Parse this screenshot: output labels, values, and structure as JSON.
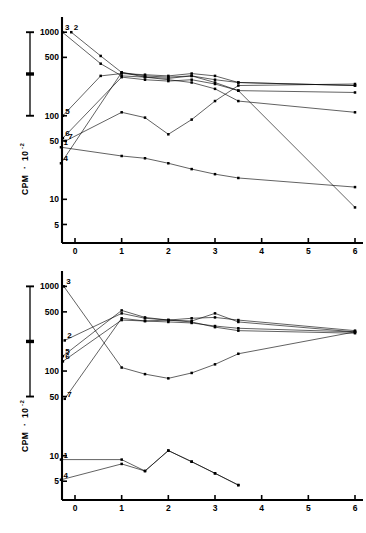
{
  "figure": {
    "panels": [
      {
        "id": "top",
        "y_axis": {
          "title_main": "CPM",
          "title_sep": "·",
          "title_base": "10",
          "title_exp": "-2",
          "tick_labels": [
            "1000",
            "500",
            "100",
            "50",
            "10",
            "5"
          ],
          "tick_values": [
            1000,
            500,
            100,
            50,
            10,
            5
          ],
          "scale": "log",
          "ylim": [
            3,
            1400
          ]
        },
        "x_axis": {
          "tick_labels": [
            "0",
            "1",
            "2",
            "3",
            "4",
            "5",
            "6"
          ],
          "tick_values": [
            0,
            1,
            2,
            3,
            4,
            5,
            6
          ],
          "scale": "linear",
          "xlim": [
            -0.45,
            6.35
          ]
        },
        "scale_bar": {
          "top_label": "1000",
          "bottom_label": "100",
          "has_mid_tick": true
        },
        "series_labels": [
          "3",
          "2",
          "5",
          "6",
          "7",
          "1",
          "4"
        ]
      },
      {
        "id": "bottom",
        "y_axis": {
          "title_main": "CPM",
          "title_sep": "·",
          "title_base": "10",
          "title_exp": "-2",
          "tick_labels": [
            "1000",
            "500",
            "100",
            "50",
            "10",
            "5"
          ],
          "tick_values": [
            1000,
            500,
            100,
            50,
            10,
            5
          ],
          "scale": "log",
          "ylim": [
            3,
            1400
          ]
        },
        "x_axis": {
          "tick_labels": [
            "0",
            "1",
            "2",
            "3",
            "4",
            "5",
            "6"
          ],
          "tick_values": [
            0,
            1,
            2,
            3,
            4,
            5,
            6
          ],
          "scale": "linear",
          "xlim": [
            -0.45,
            6.35
          ]
        },
        "scale_bar": {
          "top_label": "1000",
          "bottom_label": "50",
          "has_mid_tick": true
        },
        "series_labels": [
          "3",
          "2",
          "5",
          "6",
          "7",
          "1",
          "4"
        ]
      }
    ]
  },
  "chart_data": [
    {
      "type": "line",
      "title": "",
      "subtitle": "",
      "xlabel": "",
      "ylabel": "CPM · 10^-2",
      "yscale": "log",
      "ylim": [
        3,
        1400
      ],
      "xlim": [
        -0.45,
        6.35
      ],
      "yticks": [
        1000,
        500,
        100,
        50,
        10,
        5
      ],
      "ytick_labels": [
        "1000",
        "500",
        "100",
        "50",
        "10",
        "5"
      ],
      "xticks": [
        0,
        1,
        2,
        3,
        4,
        5,
        6
      ],
      "xtick_labels": [
        "0",
        "1",
        "2",
        "3",
        "4",
        "5",
        "6"
      ],
      "grid": false,
      "legend": "inline-numbered-labels",
      "series": [
        {
          "name": "1",
          "x": [
            -0.3,
            1.0,
            1.5,
            2.0,
            2.5,
            3.0,
            3.5,
            6.0
          ],
          "y": [
            42,
            33,
            31,
            27,
            23,
            20,
            18,
            14
          ]
        },
        {
          "name": "2",
          "x": [
            -0.08,
            0.55,
            1.0,
            1.5,
            2.0,
            2.5,
            3.0,
            3.5,
            6.0
          ],
          "y": [
            1000,
            520,
            330,
            300,
            290,
            300,
            270,
            250,
            230
          ]
        },
        {
          "name": "3",
          "x": [
            -0.27,
            0.55,
            1.0,
            1.5,
            2.0,
            2.5,
            3.0,
            3.5,
            6.0
          ],
          "y": [
            1000,
            420,
            300,
            290,
            280,
            300,
            250,
            200,
            8
          ]
        },
        {
          "name": "4",
          "x": [
            -0.3,
            1.0,
            1.5,
            2.0,
            2.5,
            3.0,
            3.5,
            6.0
          ],
          "y": [
            27,
            330,
            290,
            270,
            250,
            210,
            150,
            110
          ]
        },
        {
          "name": "5",
          "x": [
            -0.26,
            0.55,
            1.0,
            1.5,
            2.0,
            2.5,
            3.0,
            3.5,
            6.0
          ],
          "y": [
            100,
            300,
            320,
            310,
            300,
            320,
            300,
            250,
            230
          ]
        },
        {
          "name": "6",
          "x": [
            -0.26,
            1.0,
            1.5,
            2.0,
            2.5,
            3.0,
            3.5,
            6.0
          ],
          "y": [
            54,
            290,
            270,
            260,
            270,
            240,
            200,
            190
          ]
        },
        {
          "name": "7",
          "x": [
            -0.2,
            1.0,
            1.5,
            2.0,
            2.5,
            3.0,
            3.5,
            6.0
          ],
          "y": [
            50,
            110,
            95,
            60,
            90,
            150,
            230,
            240
          ]
        }
      ]
    },
    {
      "type": "line",
      "title": "",
      "subtitle": "",
      "xlabel": "",
      "ylabel": "CPM · 10^-2",
      "yscale": "log",
      "ylim": [
        3,
        1400
      ],
      "xlim": [
        -0.45,
        6.35
      ],
      "yticks": [
        1000,
        500,
        100,
        50,
        10,
        5
      ],
      "ytick_labels": [
        "1000",
        "500",
        "100",
        "50",
        "10",
        "5"
      ],
      "xticks": [
        0,
        1,
        2,
        3,
        4,
        5,
        6
      ],
      "xtick_labels": [
        "0",
        "1",
        "2",
        "3",
        "4",
        "5",
        "6"
      ],
      "grid": false,
      "legend": "inline-numbered-labels",
      "series": [
        {
          "name": "1",
          "x": [
            -0.3,
            1.0,
            1.5,
            2.0,
            2.5,
            3.0,
            3.5
          ],
          "y": [
            9.0,
            9.0,
            6.6,
            11.5,
            8.5,
            6.2,
            4.5
          ]
        },
        {
          "name": "2",
          "x": [
            -0.22,
            1.0,
            1.5,
            2.0,
            2.5,
            3.0,
            3.5,
            6.0
          ],
          "y": [
            230,
            480,
            420,
            400,
            380,
            330,
            300,
            280
          ]
        },
        {
          "name": "3",
          "x": [
            -0.24,
            1.0,
            1.5,
            2.0,
            2.5,
            3.0,
            3.5,
            6.0
          ],
          "y": [
            1000,
            110,
            92,
            82,
            95,
            120,
            160,
            290
          ]
        },
        {
          "name": "4",
          "x": [
            -0.3,
            1.0,
            1.5,
            2.0,
            2.5,
            3.0,
            3.5
          ],
          "y": [
            5.2,
            8.0,
            6.6,
            11.5,
            8.5,
            6.2,
            4.5
          ]
        },
        {
          "name": "5",
          "x": [
            -0.26,
            1.0,
            1.5,
            2.0,
            2.5,
            3.0,
            3.5,
            6.0
          ],
          "y": [
            150,
            520,
            430,
            400,
            390,
            480,
            380,
            290
          ]
        },
        {
          "name": "6",
          "x": [
            -0.26,
            1.0,
            1.5,
            2.0,
            2.5,
            3.0,
            3.5,
            6.0
          ],
          "y": [
            130,
            400,
            390,
            380,
            370,
            340,
            320,
            290
          ]
        },
        {
          "name": "7",
          "x": [
            -0.22,
            1.0,
            1.5,
            2.0,
            2.5,
            3.0,
            3.5,
            6.0
          ],
          "y": [
            47,
            420,
            390,
            400,
            420,
            430,
            400,
            300
          ]
        }
      ]
    }
  ]
}
